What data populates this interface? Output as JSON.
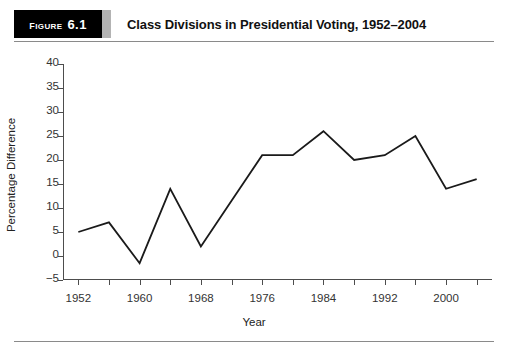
{
  "header": {
    "badge_word": "Figure",
    "badge_number": "6.1",
    "title": "Class Divisions in Presidential Voting, 1952–2004"
  },
  "colors": {
    "badge_background": "#000000",
    "badge_text": "#ffffff",
    "badge_tab": "#b3b3b3",
    "rule": "#8a8a8a",
    "axis": "#4d4d4d",
    "series_line": "#1a1a1a",
    "page_background": "#ffffff"
  },
  "chart_data": {
    "type": "line",
    "title": "Class Divisions in Presidential Voting, 1952–2004",
    "xlabel": "Year",
    "ylabel": "Percentage Difference",
    "xlim": [
      1950,
      2006
    ],
    "ylim": [
      -5,
      40
    ],
    "grid": false,
    "legend": "none",
    "yticks": [
      -5,
      0,
      5,
      10,
      15,
      20,
      25,
      30,
      35,
      40
    ],
    "ytick_labels": [
      "−5",
      "0",
      "5",
      "10",
      "15",
      "20",
      "25",
      "30",
      "35",
      "40"
    ],
    "xticks": [
      1952,
      1956,
      1960,
      1964,
      1968,
      1972,
      1976,
      1980,
      1984,
      1988,
      1992,
      1996,
      2000,
      2004
    ],
    "xtick_labels": [
      "1952",
      "",
      "1960",
      "",
      "1968",
      "",
      "1976",
      "",
      "1984",
      "",
      "1992",
      "",
      "2000",
      ""
    ],
    "x": [
      1952,
      1956,
      1960,
      1964,
      1968,
      1972,
      1976,
      1980,
      1984,
      1988,
      1992,
      1996,
      2000,
      2004
    ],
    "values": [
      5,
      7,
      -1.5,
      14,
      2,
      11.5,
      21,
      21,
      26,
      20,
      21,
      25,
      14,
      16
    ],
    "series": [
      {
        "name": "Percentage Difference",
        "values": [
          5,
          7,
          -1.5,
          14,
          2,
          11.5,
          21,
          21,
          26,
          20,
          21,
          25,
          14,
          16
        ]
      }
    ]
  }
}
